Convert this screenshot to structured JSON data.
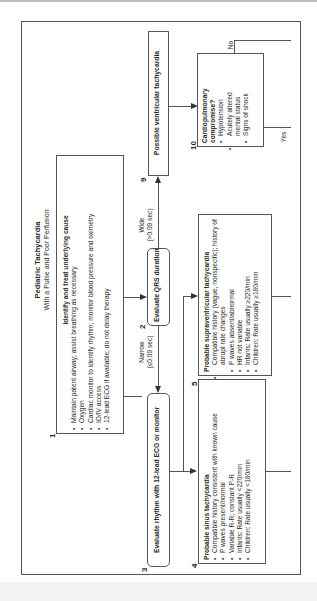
{
  "title": {
    "main": "Pediatric Tachycardia",
    "sub": "With a Pulse and Poor Perfusion"
  },
  "boxes": {
    "b1": {
      "num": "1",
      "heading": "Identify and treat underlying cause",
      "items": [
        "Maintain patent airway; assist breathing as necessary",
        "Oxygen",
        "Cardiac monitor to identify rhythm; monitor blood pressure and oximetry",
        "IO/IV access",
        "12-lead ECG if available; do not delay therapy"
      ]
    },
    "b2": {
      "num": "2",
      "text": "Evaluate QRS duration"
    },
    "b3": {
      "num": "3",
      "text": "Evaluate rhythm with 12-lead ECG or monitor"
    },
    "b4": {
      "num": "4",
      "heading": "Probable sinus tachycardia",
      "items": [
        "Compatible history consistent with known cause",
        "P waves present/normal",
        "Variable R-R; constant P-R",
        "Infants: Rate usually <220/min",
        "Children: Rate usually <180/min"
      ]
    },
    "b5": {
      "num": "5",
      "heading": "Probable supraventricular tachycardia",
      "items": [
        "Compatible history (vague, nonspecific); history of abrupt rate changes",
        "P waves absent/abnormal",
        "HR not variable",
        "Infants: Rate usually ≥220/min",
        "Children: Rate usually ≥180/min"
      ]
    },
    "b9": {
      "num": "9",
      "text": "Possible ventricular tachycardia"
    },
    "b10": {
      "num": "10",
      "heading": "Cardiopulmonary compromise?",
      "items": [
        "Hypotension",
        "Acutely altered mental status",
        "Signs of shock"
      ]
    }
  },
  "labels": {
    "narrow": "Narrow",
    "narrow_sub": "(≤0.09 sec)",
    "wide": "Wide",
    "wide_sub": "(>0.09 sec)",
    "no": "No",
    "yes": "Yes"
  }
}
